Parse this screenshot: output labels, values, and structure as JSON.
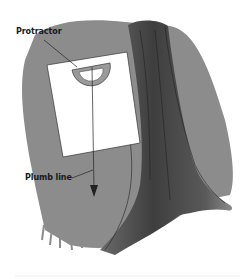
{
  "illustration": {
    "labels": {
      "protractor": "Protractor",
      "plumb_line": "Plumb line"
    },
    "colors": {
      "background": "#ffffff",
      "foliage_gray": "#8a8a8a",
      "trunk_dark": "#4a4a4a",
      "card": "#ffffff",
      "protractor": "#9a9a9a",
      "line": "#222222"
    }
  }
}
